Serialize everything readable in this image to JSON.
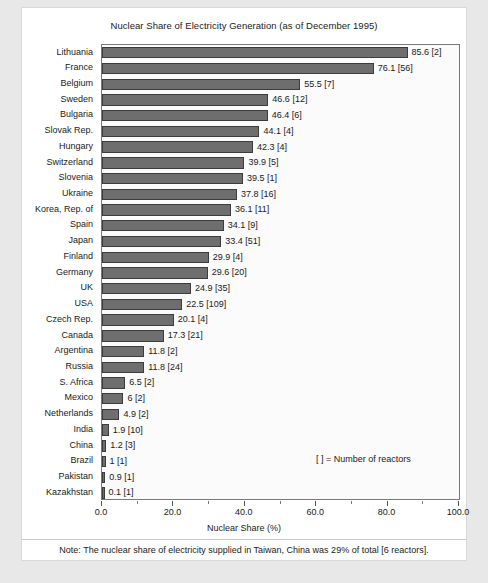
{
  "chart_data": {
    "type": "bar",
    "orientation": "horizontal",
    "title": "Nuclear Share of Electricity Generation (as of December 1995)",
    "xlabel": "Nuclear Share (%)",
    "ylabel": "",
    "xlim": [
      0,
      100
    ],
    "xticks": [
      "0.0",
      "20.0",
      "40.0",
      "60.0",
      "80.0",
      "100.0"
    ],
    "xtick_values": [
      0,
      20,
      40,
      60,
      80,
      100
    ],
    "grid": false,
    "legend_position": "inside-lower-right",
    "annotation": "[ ] = Number of reactors",
    "footnote": "Note: The nuclear share of electricity supplied in Taiwan, China was 29% of total [6 reactors].",
    "bar_color": "#6e6e6e",
    "bar_edge_color": "#3c3c3c",
    "categories": [
      "Lithuania",
      "France",
      "Belgium",
      "Sweden",
      "Bulgaria",
      "Slovak Rep.",
      "Hungary",
      "Switzerland",
      "Slovenia",
      "Ukraine",
      "Korea, Rep. of",
      "Spain",
      "Japan",
      "Finland",
      "Germany",
      "UK",
      "USA",
      "Czech Rep.",
      "Canada",
      "Argentina",
      "Russia",
      "S. Africa",
      "Mexico",
      "Netherlands",
      "India",
      "China",
      "Brazil",
      "Pakistan",
      "Kazakhstan"
    ],
    "values": [
      85.6,
      76.1,
      55.5,
      46.6,
      46.4,
      44.1,
      42.3,
      39.9,
      39.5,
      37.8,
      36.1,
      34.1,
      33.4,
      29.9,
      29.6,
      24.9,
      22.5,
      20.1,
      17.3,
      11.8,
      11.8,
      6.5,
      6,
      4.9,
      1.9,
      1.2,
      1,
      0.9,
      0.1
    ],
    "reactors": [
      2,
      56,
      7,
      12,
      6,
      4,
      4,
      5,
      1,
      16,
      11,
      9,
      51,
      4,
      20,
      35,
      109,
      4,
      21,
      2,
      24,
      2,
      2,
      2,
      10,
      3,
      1,
      1,
      1
    ],
    "data_labels": [
      "85.6 [2]",
      "76.1 [56]",
      "55.5 [7]",
      "46.6 [12]",
      "46.4 [6]",
      "44.1 [4]",
      "42.3 [4]",
      "39.9 [5]",
      "39.5 [1]",
      "37.8 [16]",
      "36.1 [11]",
      "34.1 [9]",
      "33.4 [51]",
      "29.9 [4]",
      "29.6 [20]",
      "24.9 [35]",
      "22.5 [109]",
      "20.1 [4]",
      "17.3 [21]",
      "11.8 [2]",
      "11.8 [24]",
      "6.5 [2]",
      "6 [2]",
      "4.9 [2]",
      "1.9 [10]",
      "1.2 [3]",
      "1 [1]",
      "0.9 [1]",
      "0.1 [1]"
    ]
  }
}
